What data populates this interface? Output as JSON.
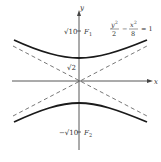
{
  "figure": {
    "axes": {
      "x_label": "x",
      "y_label": "y"
    },
    "labels": {
      "upper_focus_value": "√10",
      "upper_focus_name": "F",
      "upper_focus_sub": "1",
      "vertex_value": "√2",
      "lower_focus_value": "−√10",
      "lower_focus_name": "F",
      "lower_focus_sub": "2"
    },
    "equation": {
      "num1": "y",
      "num1_exp": "2",
      "den1": "2",
      "minus": "−",
      "num2": "x",
      "num2_exp": "2",
      "den2": "8",
      "rhs": "= 1"
    },
    "colors": {
      "curve": "#1a1a1a",
      "asymptote": "#555555",
      "axis": "#444444"
    }
  }
}
